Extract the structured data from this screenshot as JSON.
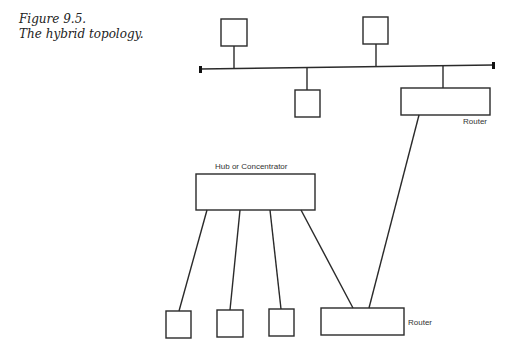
{
  "caption": {
    "figure_number": "Figure 9.5.",
    "title": "The hybrid topology."
  },
  "colors": {
    "stroke": "#2a2a2a",
    "background": "#ffffff",
    "label": "#333333"
  },
  "labels": {
    "router_top": "Router",
    "hub": "Hub or Concentrator",
    "router_bottom": "Router"
  },
  "diagram": {
    "bus": {
      "x1": 200,
      "y1": 69,
      "x2": 493,
      "y2": 65
    },
    "nodes": [
      {
        "id": "bus-node-1",
        "type": "workstation",
        "x": 221,
        "y": 19,
        "w": 26,
        "h": 27,
        "stem_x": 234
      },
      {
        "id": "bus-node-2",
        "type": "workstation",
        "x": 363,
        "y": 17,
        "w": 25,
        "h": 27,
        "stem_x": 376
      },
      {
        "id": "bus-node-3",
        "type": "workstation",
        "x": 295,
        "y": 90,
        "w": 25,
        "h": 27,
        "stem_x": 307
      },
      {
        "id": "router-top",
        "type": "router",
        "x": 401,
        "y": 88,
        "w": 89,
        "h": 27,
        "stem_x": 443
      },
      {
        "id": "hub",
        "type": "hub",
        "x": 196,
        "y": 174,
        "w": 119,
        "h": 36
      },
      {
        "id": "hub-node-1",
        "type": "workstation",
        "x": 166,
        "y": 311,
        "w": 25,
        "h": 27
      },
      {
        "id": "hub-node-2",
        "type": "workstation",
        "x": 217,
        "y": 310,
        "w": 26,
        "h": 27
      },
      {
        "id": "hub-node-3",
        "type": "workstation",
        "x": 269,
        "y": 309,
        "w": 25,
        "h": 27
      },
      {
        "id": "router-bottom",
        "type": "router",
        "x": 321,
        "y": 308,
        "w": 83,
        "h": 27
      }
    ],
    "links": [
      {
        "from": "hub",
        "to": "hub-node-1",
        "x1": 207,
        "y1": 210,
        "x2": 179,
        "y2": 311
      },
      {
        "from": "hub",
        "to": "hub-node-2",
        "x1": 240,
        "y1": 210,
        "x2": 230,
        "y2": 310
      },
      {
        "from": "hub",
        "to": "hub-node-3",
        "x1": 270,
        "y1": 210,
        "x2": 281,
        "y2": 309
      },
      {
        "from": "hub",
        "to": "router-bottom",
        "x1": 301,
        "y1": 210,
        "x2": 353,
        "y2": 308
      },
      {
        "from": "router-top",
        "to": "router-bottom",
        "x1": 419,
        "y1": 115,
        "x2": 369,
        "y2": 308
      }
    ]
  }
}
